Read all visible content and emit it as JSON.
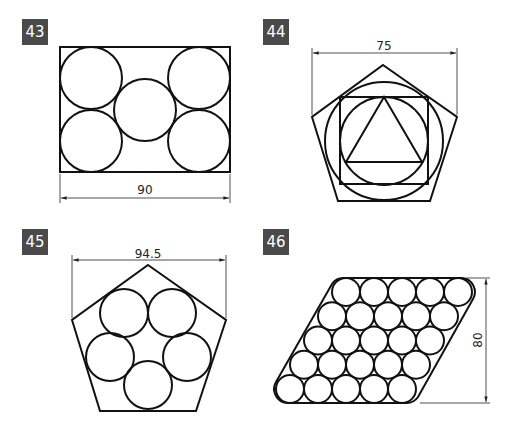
{
  "figures": [
    {
      "number": "43",
      "dimension": "90",
      "description": "Rectangle with five inscribed tangent circles"
    },
    {
      "number": "44",
      "dimension": "75",
      "description": "Pentagon containing circle, square, inner circle and triangle"
    },
    {
      "number": "45",
      "dimension": "94.5",
      "description": "Pentagon with five tangent circles"
    },
    {
      "number": "46",
      "dimension": "80",
      "description": "Parallelogram packed with 25 circles in 5 rows"
    }
  ],
  "colors": {
    "label_bg": "#4a4a4a",
    "stroke": "#111111"
  }
}
